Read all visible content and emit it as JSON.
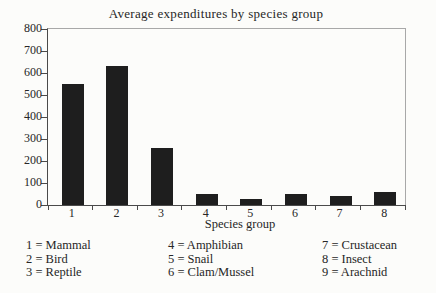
{
  "chart_data": {
    "type": "bar",
    "title": "Average expenditures by species group",
    "xlabel": "Species group",
    "ylabel": "",
    "categories": [
      "1",
      "2",
      "3",
      "4",
      "5",
      "6",
      "7",
      "8"
    ],
    "values": [
      550,
      630,
      260,
      50,
      25,
      50,
      40,
      60
    ],
    "ylim": [
      0,
      800
    ],
    "ytick_step": 100,
    "grid": false,
    "legend_position": "below-chart",
    "legend_columns": [
      [
        "1 = Mammal",
        "2 = Bird",
        "3 = Reptile"
      ],
      [
        "4 = Amphibian",
        "5 = Snail",
        "6 = Clam/Mussel"
      ],
      [
        "7 = Crustacean",
        "8 = Insect",
        "9 = Arachnid"
      ]
    ]
  },
  "colors": {
    "bar": "#1e1e1e",
    "axis": "#4a4a4a",
    "frame": "#a8a8a8",
    "text": "#262626",
    "background": "#fcfcfa"
  }
}
